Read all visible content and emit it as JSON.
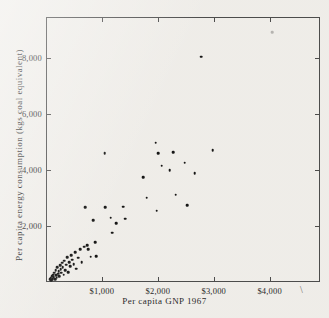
{
  "chart_data": {
    "type": "scatter",
    "title": "",
    "xlabel": "Per capita GNP 1967",
    "ylabel": "Per capita energy consumption (kgs coal equivalent)",
    "xlim": [
      0,
      4900
    ],
    "ylim": [
      0,
      9450
    ],
    "grid": false,
    "legend": null,
    "xticks": [
      1000,
      2000,
      3000,
      4000
    ],
    "xticklabels": [
      "$1,000",
      "$2,000",
      "$3,000",
      "$4,000"
    ],
    "yticks": [
      2000,
      4000,
      6000,
      8000
    ],
    "yticklabels": [
      "2,000",
      "4,000",
      "6,000",
      "8,000"
    ],
    "marker": "filled-circle",
    "marker_color": "#111111",
    "points": [
      {
        "x": 70,
        "y": 90
      },
      {
        "x": 85,
        "y": 130
      },
      {
        "x": 95,
        "y": 60
      },
      {
        "x": 110,
        "y": 200
      },
      {
        "x": 120,
        "y": 110
      },
      {
        "x": 130,
        "y": 260
      },
      {
        "x": 140,
        "y": 170
      },
      {
        "x": 150,
        "y": 330
      },
      {
        "x": 160,
        "y": 95
      },
      {
        "x": 170,
        "y": 420
      },
      {
        "x": 180,
        "y": 240
      },
      {
        "x": 190,
        "y": 150
      },
      {
        "x": 205,
        "y": 520
      },
      {
        "x": 215,
        "y": 300
      },
      {
        "x": 225,
        "y": 390
      },
      {
        "x": 240,
        "y": 200
      },
      {
        "x": 250,
        "y": 600
      },
      {
        "x": 265,
        "y": 450
      },
      {
        "x": 275,
        "y": 330
      },
      {
        "x": 290,
        "y": 690
      },
      {
        "x": 300,
        "y": 520
      },
      {
        "x": 315,
        "y": 260
      },
      {
        "x": 330,
        "y": 760
      },
      {
        "x": 345,
        "y": 430
      },
      {
        "x": 360,
        "y": 620
      },
      {
        "x": 380,
        "y": 880
      },
      {
        "x": 395,
        "y": 350
      },
      {
        "x": 415,
        "y": 700
      },
      {
        "x": 430,
        "y": 560
      },
      {
        "x": 450,
        "y": 960
      },
      {
        "x": 470,
        "y": 790
      },
      {
        "x": 495,
        "y": 640
      },
      {
        "x": 520,
        "y": 1060
      },
      {
        "x": 545,
        "y": 480
      },
      {
        "x": 575,
        "y": 860
      },
      {
        "x": 610,
        "y": 1180
      },
      {
        "x": 640,
        "y": 700
      },
      {
        "x": 680,
        "y": 1260
      },
      {
        "x": 700,
        "y": 2660
      },
      {
        "x": 735,
        "y": 1320
      },
      {
        "x": 760,
        "y": 1180
      },
      {
        "x": 800,
        "y": 900
      },
      {
        "x": 840,
        "y": 2210
      },
      {
        "x": 880,
        "y": 1410
      },
      {
        "x": 900,
        "y": 930
      },
      {
        "x": 1050,
        "y": 4600
      },
      {
        "x": 1060,
        "y": 2660
      },
      {
        "x": 1160,
        "y": 2290
      },
      {
        "x": 1180,
        "y": 1760
      },
      {
        "x": 1260,
        "y": 2090
      },
      {
        "x": 1380,
        "y": 2690
      },
      {
        "x": 1420,
        "y": 2250
      },
      {
        "x": 1740,
        "y": 3730
      },
      {
        "x": 1800,
        "y": 3000
      },
      {
        "x": 1960,
        "y": 4970
      },
      {
        "x": 1980,
        "y": 2540
      },
      {
        "x": 2010,
        "y": 4590
      },
      {
        "x": 2070,
        "y": 4150
      },
      {
        "x": 2210,
        "y": 3980
      },
      {
        "x": 2270,
        "y": 4620
      },
      {
        "x": 2320,
        "y": 3110
      },
      {
        "x": 2480,
        "y": 4260
      },
      {
        "x": 2530,
        "y": 2740
      },
      {
        "x": 2660,
        "y": 3880
      },
      {
        "x": 2780,
        "y": 8030
      },
      {
        "x": 2980,
        "y": 4700
      },
      {
        "x": 4050,
        "y": 8900,
        "faint": true
      }
    ]
  },
  "artifacts": {
    "stray_mark": "\\"
  }
}
